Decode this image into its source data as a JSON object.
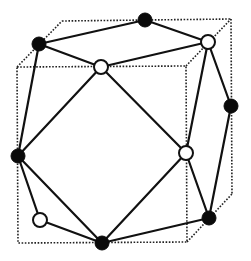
{
  "diagram": {
    "title": "",
    "colors": {
      "background": "#ffffff",
      "edge": "#111111",
      "cube": "#222222",
      "black_node": "#0a0a0a",
      "white_node_fill": "#ffffff",
      "white_node_stroke": "#111111"
    },
    "cube": {
      "front_face": [
        [
          17,
          67
        ],
        [
          186,
          66
        ],
        [
          187,
          242
        ],
        [
          18,
          243
        ]
      ],
      "back_face": [
        [
          62,
          21
        ],
        [
          231,
          19
        ],
        [
          232,
          194
        ],
        [
          63,
          196
        ]
      ],
      "visible_back_edges": [
        [
          [
            62,
            21
          ],
          [
            231,
            19
          ]
        ],
        [
          [
            231,
            19
          ],
          [
            232,
            194
          ]
        ],
        [
          [
            17,
            67
          ],
          [
            62,
            21
          ]
        ],
        [
          [
            186,
            66
          ],
          [
            231,
            19
          ]
        ],
        [
          [
            187,
            242
          ],
          [
            232,
            194
          ]
        ]
      ]
    },
    "nodes": [
      {
        "id": "n1",
        "type": "black",
        "x": 39,
        "y": 44
      },
      {
        "id": "n2",
        "type": "black",
        "x": 145,
        "y": 20
      },
      {
        "id": "n3",
        "type": "white",
        "x": 208,
        "y": 42
      },
      {
        "id": "n4",
        "type": "white",
        "x": 101,
        "y": 67
      },
      {
        "id": "n5",
        "type": "black",
        "x": 231,
        "y": 106
      },
      {
        "id": "n6",
        "type": "black",
        "x": 18,
        "y": 156
      },
      {
        "id": "n7",
        "type": "white",
        "x": 186,
        "y": 153
      },
      {
        "id": "n8",
        "type": "white",
        "x": 40,
        "y": 220
      },
      {
        "id": "n9",
        "type": "black",
        "x": 209,
        "y": 218
      },
      {
        "id": "n10",
        "type": "black",
        "x": 102,
        "y": 243
      }
    ],
    "edges": [
      [
        "n1",
        "n2"
      ],
      [
        "n2",
        "n3"
      ],
      [
        "n1",
        "n4"
      ],
      [
        "n4",
        "n3"
      ],
      [
        "n1",
        "n6"
      ],
      [
        "n4",
        "n6"
      ],
      [
        "n4",
        "n7"
      ],
      [
        "n3",
        "n7"
      ],
      [
        "n3",
        "n5"
      ],
      [
        "n5",
        "n9"
      ],
      [
        "n7",
        "n9"
      ],
      [
        "n6",
        "n8"
      ],
      [
        "n6",
        "n10"
      ],
      [
        "n8",
        "n10"
      ],
      [
        "n10",
        "n9"
      ],
      [
        "n7",
        "n10"
      ]
    ],
    "node_radius": 7
  }
}
